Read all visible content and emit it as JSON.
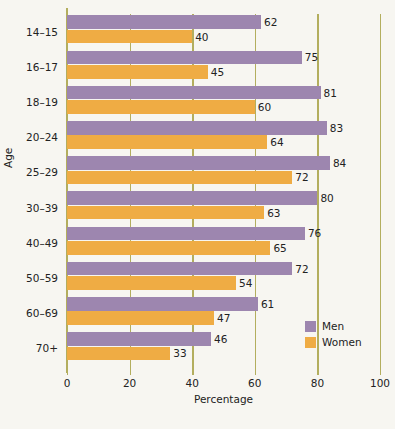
{
  "chart_data": {
    "type": "bar",
    "orientation": "horizontal",
    "title": "",
    "xlabel": "Percentage",
    "ylabel": "Age",
    "xlim": [
      0,
      100
    ],
    "xticks": [
      "0",
      "20",
      "40",
      "60",
      "80",
      "100"
    ],
    "grid": true,
    "legend_position": "inside-right",
    "categories": [
      "14–15",
      "16–17",
      "18–19",
      "20–24",
      "25–29",
      "30–39",
      "40–49",
      "50–59",
      "60–69",
      "70+"
    ],
    "series": [
      {
        "name": "Men",
        "color": "#9d86af",
        "values": [
          62,
          75,
          81,
          83,
          84,
          80,
          76,
          72,
          61,
          46
        ]
      },
      {
        "name": "Women",
        "color": "#efac44",
        "values": [
          40,
          45,
          60,
          64,
          72,
          63,
          65,
          54,
          47,
          33
        ]
      }
    ]
  },
  "colors": {
    "men": "#9d86af",
    "women": "#efac44",
    "axis": "#b3ae5e",
    "background": "#f7f6f1",
    "text": "#222222"
  }
}
